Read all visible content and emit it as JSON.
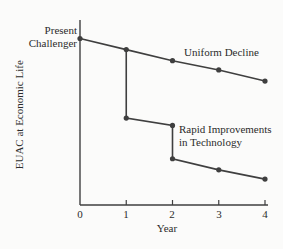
{
  "chart_data": {
    "type": "line",
    "title": "",
    "xlabel": "Year",
    "ylabel": "EUAC at Economic Life",
    "x_ticks": [
      "0",
      "1",
      "2",
      "3",
      "4"
    ],
    "xlim": [
      0,
      4
    ],
    "ylim": [
      0,
      100
    ],
    "grid": false,
    "legend_position": "inline-annotations",
    "y_axis_numeric_labels": false,
    "colors": {
      "line": "#3f3f3f",
      "marker": "#3f3f3f",
      "text": "#2b2b2b",
      "background": "#fbfbfa"
    },
    "series": [
      {
        "name": "Uniform Decline",
        "points": [
          [
            0,
            90
          ],
          [
            1,
            84
          ],
          [
            2,
            78
          ],
          [
            3,
            73
          ],
          [
            4,
            67
          ]
        ],
        "markers": [
          [
            0,
            90
          ],
          [
            1,
            84
          ],
          [
            2,
            78
          ],
          [
            3,
            73
          ],
          [
            4,
            67
          ]
        ]
      },
      {
        "name": "Rapid Improvements in Technology",
        "points": [
          [
            1,
            84
          ],
          [
            1,
            47
          ],
          [
            2,
            43
          ],
          [
            2,
            25
          ],
          [
            3,
            19
          ],
          [
            4,
            14
          ]
        ],
        "markers": [
          [
            1,
            47
          ],
          [
            2,
            43
          ],
          [
            2,
            25
          ],
          [
            3,
            19
          ],
          [
            4,
            14
          ]
        ]
      }
    ],
    "annotations": [
      {
        "text": "Present\nChallenger",
        "at": [
          0,
          90
        ],
        "position": "left-of-point"
      },
      {
        "text": "Uniform Decline",
        "at": [
          2.2,
          85
        ],
        "position": "above-line"
      },
      {
        "text": "Rapid Improvements\nin Technology",
        "at": [
          2.1,
          38
        ],
        "position": "right-of-step"
      }
    ]
  }
}
